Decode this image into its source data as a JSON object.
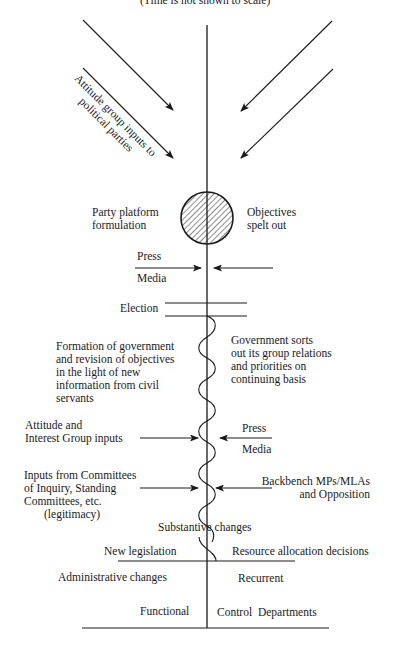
{
  "title": "(Time is not shown to scale)",
  "top": {
    "diagonal_label_line1": "Attitude group inputs to",
    "diagonal_label_line2": "political parties"
  },
  "circle": {
    "left_line1": "Party platform",
    "left_line2": "formulation",
    "right_line1": "Objectives",
    "right_line2": "spelt out"
  },
  "press_media_1": {
    "top": "Press",
    "bottom": "Media"
  },
  "election": "Election",
  "formation": {
    "lines": [
      "Formation of government",
      "and revision of objectives",
      "in the light of new",
      "information from civil",
      "servants"
    ]
  },
  "gov_sorts": {
    "lines": [
      "Government sorts",
      "out its group relations",
      "and priorities on",
      "continuing basis"
    ]
  },
  "attitude_interest": {
    "line1": "Attitude and",
    "line2": "Interest Group inputs"
  },
  "press_media_2": {
    "top": "Press",
    "bottom": "Media"
  },
  "committees": {
    "lines": [
      "Inputs from Committees",
      "of Inquiry, Standing",
      "Committees, etc.",
      "(legitimacy)"
    ]
  },
  "backbench": {
    "line1": "Backbench MPs/MLAs",
    "line2": "and Opposition"
  },
  "substantive": "Substantive changes",
  "new_legislation": "New legislation",
  "resource_allocation": "Resource allocation decisions",
  "administrative": "Administrative changes",
  "recurrent": "Recurrent",
  "functional": "Functional",
  "control_departments": "Control  Departments",
  "colors": {
    "ink": "#1a1a1a",
    "background": "#ffffff"
  }
}
